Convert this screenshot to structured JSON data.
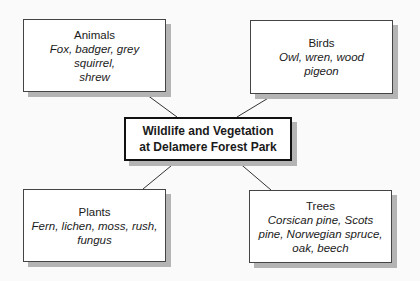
{
  "diagram": {
    "center": {
      "line1": "Wildlife and Vegetation",
      "line2": "at Delamere Forest Park"
    },
    "nodes": [
      {
        "id": "animals",
        "title": "Animals",
        "items": [
          "Fox, badger, grey",
          "squirrel,",
          "shrew"
        ]
      },
      {
        "id": "birds",
        "title": "Birds",
        "items": [
          "Owl, wren, wood",
          "pigeon"
        ]
      },
      {
        "id": "plants",
        "title": "Plants",
        "items": [
          "Fern, lichen, moss, rush,",
          "fungus"
        ]
      },
      {
        "id": "trees",
        "title": "Trees",
        "items": [
          "Corsican pine, Scots",
          "pine, Norwegian spruce,",
          "oak, beech"
        ]
      }
    ],
    "colors": {
      "border": "#444444",
      "shadow": "#b4b4b4",
      "background": "#fafafa"
    }
  }
}
